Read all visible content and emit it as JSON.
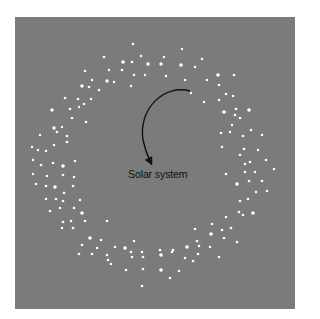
{
  "figure": {
    "panel": {
      "x": 15,
      "y": 17,
      "width": 280,
      "height": 292,
      "background": "#7b7b7b"
    },
    "label": {
      "text": "Solar system",
      "x": 128,
      "y": 168
    },
    "arrow": {
      "path": "M190,91 C165,84 138,108 143,140 C145,150 148,157 151,163",
      "color": "#111111",
      "head": [
        152,
        166
      ]
    },
    "star_color": "#ffffff",
    "stars": [
      [
        133,
        44,
        1.3
      ],
      [
        182,
        49,
        1.2
      ],
      [
        104,
        57,
        1.3
      ],
      [
        141,
        56,
        1.2
      ],
      [
        202,
        59,
        1.2
      ],
      [
        123,
        62,
        1.8
      ],
      [
        132,
        62,
        1.3
      ],
      [
        148,
        64,
        1.7
      ],
      [
        161,
        64,
        1.7
      ],
      [
        164,
        57,
        1.2
      ],
      [
        181,
        65,
        1.8
      ],
      [
        195,
        67,
        1.2
      ],
      [
        85,
        71,
        1.3
      ],
      [
        109,
        70,
        1.2
      ],
      [
        122,
        70,
        1.3
      ],
      [
        145,
        75,
        1.2
      ],
      [
        166,
        76,
        1.2
      ],
      [
        134,
        75,
        1.2
      ],
      [
        218,
        75,
        1.8
      ],
      [
        234,
        75,
        1.3
      ],
      [
        92,
        80,
        1.2
      ],
      [
        107,
        81,
        1.7
      ],
      [
        114,
        82,
        1.2
      ],
      [
        82,
        86,
        1.7
      ],
      [
        89,
        87,
        1.3
      ],
      [
        131,
        86,
        1.2
      ],
      [
        99,
        90,
        1.3
      ],
      [
        185,
        80,
        1.3
      ],
      [
        207,
        80,
        1.3
      ],
      [
        219,
        85,
        1.3
      ],
      [
        191,
        93,
        1.2
      ],
      [
        65,
        98,
        1.3
      ],
      [
        78,
        99,
        1.3
      ],
      [
        91,
        99,
        1.2
      ],
      [
        84,
        104,
        1.3
      ],
      [
        204,
        102,
        1.2
      ],
      [
        219,
        100,
        1.3
      ],
      [
        226,
        94,
        1.3
      ],
      [
        233,
        96,
        1.3
      ],
      [
        52,
        110,
        1.7
      ],
      [
        70,
        109,
        1.3
      ],
      [
        79,
        107,
        1.2
      ],
      [
        224,
        112,
        1.8
      ],
      [
        236,
        109,
        1.3
      ],
      [
        249,
        110,
        1.8
      ],
      [
        72,
        118,
        1.3
      ],
      [
        86,
        122,
        1.3
      ],
      [
        240,
        118,
        1.3
      ],
      [
        235,
        115,
        1.3
      ],
      [
        232,
        125,
        1.2
      ],
      [
        54,
        128,
        1.7
      ],
      [
        62,
        127,
        1.2
      ],
      [
        57,
        132,
        1.3
      ],
      [
        67,
        136,
        1.3
      ],
      [
        230,
        132,
        1.2
      ],
      [
        243,
        136,
        1.3
      ],
      [
        251,
        130,
        1.3
      ],
      [
        40,
        135,
        1.2
      ],
      [
        262,
        135,
        1.3
      ],
      [
        67,
        142,
        1.3
      ],
      [
        221,
        133,
        1.3
      ],
      [
        32,
        147,
        1.2
      ],
      [
        38,
        150,
        1.2
      ],
      [
        46,
        151,
        1.3
      ],
      [
        54,
        145,
        1.3
      ],
      [
        222,
        147,
        1.2
      ],
      [
        244,
        149,
        1.3
      ],
      [
        258,
        150,
        1.2
      ],
      [
        240,
        155,
        1.3
      ],
      [
        266,
        160,
        1.3
      ],
      [
        33,
        160,
        1.2
      ],
      [
        41,
        165,
        1.3
      ],
      [
        53,
        163,
        1.3
      ],
      [
        63,
        166,
        1.8
      ],
      [
        75,
        161,
        1.3
      ],
      [
        245,
        164,
        1.3
      ],
      [
        250,
        162,
        1.3
      ],
      [
        33,
        174,
        1.2
      ],
      [
        47,
        176,
        1.3
      ],
      [
        63,
        175,
        1.3
      ],
      [
        74,
        177,
        1.3
      ],
      [
        226,
        174,
        1.3
      ],
      [
        245,
        172,
        1.3
      ],
      [
        255,
        172,
        1.2
      ],
      [
        274,
        169,
        1.3
      ],
      [
        36,
        184,
        1.3
      ],
      [
        46,
        186,
        1.3
      ],
      [
        55,
        187,
        1.8
      ],
      [
        73,
        186,
        1.3
      ],
      [
        237,
        184,
        1.8
      ],
      [
        249,
        181,
        1.3
      ],
      [
        262,
        181,
        1.3
      ],
      [
        64,
        193,
        1.3
      ],
      [
        80,
        200,
        1.3
      ],
      [
        256,
        192,
        1.3
      ],
      [
        267,
        191,
        1.3
      ],
      [
        46,
        199,
        1.3
      ],
      [
        56,
        199,
        1.3
      ],
      [
        63,
        201,
        1.3
      ],
      [
        240,
        201,
        1.3
      ],
      [
        248,
        199,
        1.3
      ],
      [
        50,
        211,
        1.3
      ],
      [
        60,
        208,
        1.3
      ],
      [
        74,
        208,
        1.3
      ],
      [
        239,
        212,
        1.3
      ],
      [
        253,
        213,
        1.8
      ],
      [
        63,
        222,
        1.3
      ],
      [
        71,
        221,
        1.3
      ],
      [
        82,
        213,
        1.8
      ],
      [
        85,
        221,
        1.3
      ],
      [
        107,
        221,
        1.3
      ],
      [
        226,
        217,
        1.3
      ],
      [
        243,
        215,
        1.3
      ],
      [
        62,
        228,
        1.3
      ],
      [
        73,
        228,
        1.3
      ],
      [
        212,
        224,
        1.3
      ],
      [
        231,
        228,
        1.3
      ],
      [
        224,
        238,
        1.3
      ],
      [
        195,
        229,
        1.3
      ],
      [
        237,
        242,
        1.3
      ],
      [
        90,
        238,
        1.8
      ],
      [
        101,
        240,
        1.3
      ],
      [
        134,
        241,
        1.3
      ],
      [
        211,
        234,
        1.8
      ],
      [
        222,
        230,
        1.3
      ],
      [
        197,
        241,
        1.3
      ],
      [
        82,
        245,
        1.3
      ],
      [
        97,
        248,
        1.3
      ],
      [
        115,
        247,
        1.3
      ],
      [
        125,
        248,
        1.8
      ],
      [
        131,
        252,
        1.3
      ],
      [
        160,
        250,
        1.3
      ],
      [
        173,
        250,
        1.3
      ],
      [
        187,
        247,
        1.8
      ],
      [
        199,
        246,
        1.3
      ],
      [
        210,
        247,
        1.3
      ],
      [
        219,
        257,
        1.3
      ],
      [
        79,
        254,
        1.3
      ],
      [
        92,
        254,
        1.3
      ],
      [
        107,
        255,
        1.3
      ],
      [
        142,
        252,
        1.3
      ],
      [
        172,
        252,
        1.3
      ],
      [
        198,
        254,
        1.3
      ],
      [
        108,
        260,
        1.3
      ],
      [
        111,
        264,
        1.3
      ],
      [
        132,
        257,
        1.3
      ],
      [
        143,
        257,
        1.3
      ],
      [
        161,
        255,
        1.8
      ],
      [
        185,
        258,
        1.3
      ],
      [
        193,
        261,
        1.3
      ],
      [
        126,
        270,
        1.3
      ],
      [
        143,
        269,
        1.3
      ],
      [
        161,
        270,
        1.8
      ],
      [
        179,
        271,
        1.3
      ],
      [
        170,
        278,
        1.3
      ],
      [
        142,
        286,
        1.3
      ]
    ]
  }
}
